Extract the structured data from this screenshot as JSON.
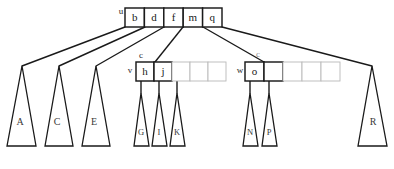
{
  "figure": {
    "type": "b-tree-diagram",
    "width": 394,
    "height": 169,
    "background": "#ffffff",
    "stroke_dark": "#1a1a1a",
    "stroke_light": "#b9b9b9",
    "text_color": "#1a1a1a"
  },
  "nodes": {
    "root": {
      "label": "u",
      "label_x": 121,
      "label_y": 12,
      "x": 125,
      "y": 8,
      "cell_w": 19.4,
      "cell_h": 19,
      "cells": [
        {
          "key": "b",
          "filled": true
        },
        {
          "key": "d",
          "filled": true
        },
        {
          "key": "f",
          "filled": true
        },
        {
          "key": "m",
          "filled": true
        },
        {
          "key": "q",
          "filled": true
        }
      ]
    },
    "left_child": {
      "label": "v",
      "label_x": 130,
      "label_y": 71,
      "upper_label": "c",
      "upper_label_x": 141,
      "upper_label_y": 56,
      "x": 136,
      "y": 62,
      "cell_w": 18,
      "cell_h": 19,
      "cells": [
        {
          "key": "h",
          "filled": true
        },
        {
          "key": "j",
          "filled": true
        },
        {
          "key": "",
          "filled": false
        },
        {
          "key": "",
          "filled": false
        },
        {
          "key": "",
          "filled": false
        }
      ]
    },
    "right_child": {
      "label": "w",
      "label_x": 240,
      "label_y": 71,
      "upper_label": "c",
      "upper_label_x": 258,
      "upper_label_y": 55,
      "x": 245,
      "y": 62,
      "cell_w": 19,
      "cell_h": 19,
      "cells": [
        {
          "key": "o",
          "filled": true
        },
        {
          "key": "",
          "filled": true
        },
        {
          "key": "",
          "filled": false
        },
        {
          "key": "",
          "filled": false
        },
        {
          "key": "",
          "filled": false
        }
      ]
    }
  },
  "subtrees": [
    {
      "name": "subtree-a",
      "label": "A",
      "apex_x": 22,
      "apex_y": 66,
      "base_left_x": 7,
      "base_right_x": 36,
      "base_y": 146,
      "label_x": 20,
      "label_y": 123,
      "size": "wide"
    },
    {
      "name": "subtree-c",
      "label": "C",
      "apex_x": 59,
      "apex_y": 66,
      "base_left_x": 45,
      "base_right_x": 73,
      "base_y": 146,
      "label_x": 57,
      "label_y": 123,
      "size": "wide"
    },
    {
      "name": "subtree-e",
      "label": "E",
      "apex_x": 96,
      "apex_y": 66,
      "base_left_x": 82,
      "base_right_x": 110,
      "base_y": 146,
      "label_x": 94,
      "label_y": 123,
      "size": "wide"
    },
    {
      "name": "subtree-g",
      "label": "G",
      "apex_x": 141,
      "apex_y": 93,
      "base_left_x": 134,
      "base_right_x": 149,
      "base_y": 146,
      "label_x": 141,
      "label_y": 133,
      "size": "narrow"
    },
    {
      "name": "subtree-i",
      "label": "I",
      "apex_x": 159,
      "apex_y": 93,
      "base_left_x": 152,
      "base_right_x": 167,
      "base_y": 146,
      "label_x": 159,
      "label_y": 133,
      "size": "narrow"
    },
    {
      "name": "subtree-k",
      "label": "K",
      "apex_x": 177,
      "apex_y": 93,
      "base_left_x": 170,
      "base_right_x": 185,
      "base_y": 146,
      "label_x": 177,
      "label_y": 133,
      "size": "narrow"
    },
    {
      "name": "subtree-n",
      "label": "N",
      "apex_x": 250,
      "apex_y": 93,
      "base_left_x": 243,
      "base_right_x": 258,
      "base_y": 146,
      "label_x": 250,
      "label_y": 133,
      "size": "narrow"
    },
    {
      "name": "subtree-p",
      "label": "P",
      "apex_x": 269,
      "apex_y": 93,
      "base_left_x": 262,
      "base_right_x": 277,
      "base_y": 146,
      "label_x": 269,
      "label_y": 133,
      "size": "narrow"
    },
    {
      "name": "subtree-r",
      "label": "R",
      "apex_x": 372,
      "apex_y": 66,
      "base_left_x": 358,
      "base_right_x": 387,
      "base_y": 146,
      "label_x": 373,
      "label_y": 123,
      "size": "wide"
    }
  ],
  "edges": [
    {
      "name": "edge-root-to-a",
      "x1": 125,
      "y1": 27,
      "x2": 22,
      "y2": 66
    },
    {
      "name": "edge-root-to-c",
      "x1": 145,
      "y1": 27,
      "x2": 59,
      "y2": 66
    },
    {
      "name": "edge-root-to-e",
      "x1": 164,
      "y1": 27,
      "x2": 96,
      "y2": 66
    },
    {
      "name": "edge-root-to-v",
      "x1": 183,
      "y1": 27,
      "x2": 155,
      "y2": 62
    },
    {
      "name": "edge-root-to-w",
      "x1": 203,
      "y1": 27,
      "x2": 264,
      "y2": 62
    },
    {
      "name": "edge-root-to-r",
      "x1": 222,
      "y1": 27,
      "x2": 372,
      "y2": 66
    },
    {
      "name": "edge-v-to-g",
      "x1": 141,
      "y1": 81,
      "x2": 141,
      "y2": 93
    },
    {
      "name": "edge-v-to-i",
      "x1": 159,
      "y1": 81,
      "x2": 159,
      "y2": 93
    },
    {
      "name": "edge-v-to-k",
      "x1": 177,
      "y1": 81,
      "x2": 177,
      "y2": 93
    },
    {
      "name": "edge-w-to-n",
      "x1": 250,
      "y1": 81,
      "x2": 250,
      "y2": 93
    },
    {
      "name": "edge-w-to-p",
      "x1": 269,
      "y1": 81,
      "x2": 269,
      "y2": 93
    }
  ]
}
